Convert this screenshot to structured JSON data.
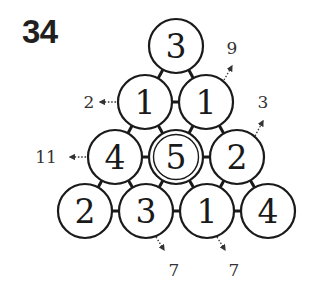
{
  "puzzle": {
    "number": "34",
    "type": "number-triangle",
    "circle_radius": 27,
    "colors": {
      "stroke": "#1a1a1a",
      "background": "#ffffff",
      "text": "#1a1a1a"
    },
    "rows": [
      [
        {
          "id": "r1c1",
          "value": "3",
          "cx": 176,
          "cy": 46,
          "highlight": false
        }
      ],
      [
        {
          "id": "r2c1",
          "value": "1",
          "cx": 145,
          "cy": 102,
          "highlight": false
        },
        {
          "id": "r2c2",
          "value": "1",
          "cx": 206,
          "cy": 102,
          "highlight": false
        }
      ],
      [
        {
          "id": "r3c1",
          "value": "4",
          "cx": 115,
          "cy": 157,
          "highlight": false
        },
        {
          "id": "r3c2",
          "value": "5",
          "cx": 176,
          "cy": 157,
          "highlight": true
        },
        {
          "id": "r3c3",
          "value": "2",
          "cx": 237,
          "cy": 157,
          "highlight": false
        }
      ],
      [
        {
          "id": "r4c1",
          "value": "2",
          "cx": 85,
          "cy": 211,
          "highlight": false
        },
        {
          "id": "r4c2",
          "value": "3",
          "cx": 146,
          "cy": 211,
          "highlight": false
        },
        {
          "id": "r4c3",
          "value": "1",
          "cx": 207,
          "cy": 211,
          "highlight": false
        },
        {
          "id": "r4c4",
          "value": "4",
          "cx": 268,
          "cy": 211,
          "highlight": false
        }
      ]
    ],
    "clues": [
      {
        "id": "clue-row2-left",
        "value": "2",
        "direction": "left",
        "x": 89,
        "y": 108,
        "arrow": [
          116,
          102,
          100,
          102
        ]
      },
      {
        "id": "clue-row3-left",
        "value": "11",
        "direction": "left",
        "x": 46,
        "y": 163,
        "arrow": [
          86,
          157,
          70,
          157
        ]
      },
      {
        "id": "clue-diag-top-right",
        "value": "9",
        "direction": "up-right",
        "x": 232,
        "y": 54,
        "arrow": [
          224,
          80,
          232,
          66
        ]
      },
      {
        "id": "clue-diag-mid-right",
        "value": "3",
        "direction": "up-right",
        "x": 263,
        "y": 108,
        "arrow": [
          255,
          136,
          263,
          121
        ]
      },
      {
        "id": "clue-bottom-1",
        "value": "7",
        "direction": "down-right",
        "x": 174,
        "y": 276,
        "arrow": [
          156,
          237,
          164,
          250
        ]
      },
      {
        "id": "clue-bottom-2",
        "value": "7",
        "direction": "down-right",
        "x": 234,
        "y": 276,
        "arrow": [
          217,
          237,
          225,
          250
        ]
      }
    ]
  }
}
